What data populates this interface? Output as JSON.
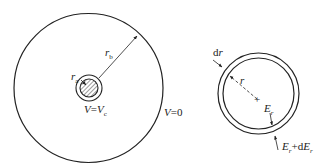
{
  "colors": {
    "stroke": "#222222",
    "background": "#ffffff"
  },
  "left_figure": {
    "outer_radius_label": {
      "main": "r",
      "sub": "b"
    },
    "inner_radius_label": {
      "main": "r",
      "sub": "a"
    },
    "inner_potential_label": {
      "lhs": "V",
      "eq": "=",
      "rhs": "V",
      "rhs_sub": "c"
    },
    "outer_potential_label": {
      "lhs": "V",
      "eq": "=",
      "rhs": "0"
    }
  },
  "right_figure": {
    "shell_thickness_label": {
      "d": "d",
      "var": "r"
    },
    "radius_label": "r",
    "center_marker": "+",
    "inner_field_label": {
      "main": "E",
      "sub": "r"
    },
    "outer_field_label": {
      "main": "E",
      "sub": "r",
      "plus": "+",
      "d": "d",
      "main2": "E",
      "sub2": "r"
    }
  }
}
